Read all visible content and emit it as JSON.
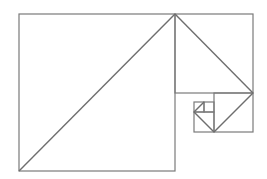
{
  "diagram": {
    "type": "golden-rectangle-fibonacci-spiral",
    "colors": {
      "background": "#ffffff",
      "stroke": "#7a7a7a",
      "diagonal": "#6e6e6e"
    },
    "squares": [
      {
        "id": "sq1",
        "x": 19,
        "y": 14,
        "w": 156,
        "h": 157
      },
      {
        "id": "sq2",
        "x": 175,
        "y": 14,
        "w": 78,
        "h": 79
      },
      {
        "id": "sq3",
        "x": 214,
        "y": 93,
        "w": 39,
        "h": 39
      },
      {
        "id": "sq4",
        "x": 194,
        "y": 112,
        "w": 20,
        "h": 20
      },
      {
        "id": "sq5",
        "x": 194,
        "y": 102,
        "w": 10,
        "h": 10
      },
      {
        "id": "sq6",
        "x": 204,
        "y": 102,
        "w": 10,
        "h": 10
      }
    ],
    "diagonals": [
      {
        "x1": 19,
        "y1": 171,
        "x2": 175,
        "y2": 14
      },
      {
        "x1": 175,
        "y1": 14,
        "x2": 253,
        "y2": 93
      },
      {
        "x1": 253,
        "y1": 93,
        "x2": 214,
        "y2": 132
      },
      {
        "x1": 214,
        "y1": 132,
        "x2": 194,
        "y2": 112
      },
      {
        "x1": 194,
        "y1": 112,
        "x2": 204,
        "y2": 102
      }
    ]
  }
}
